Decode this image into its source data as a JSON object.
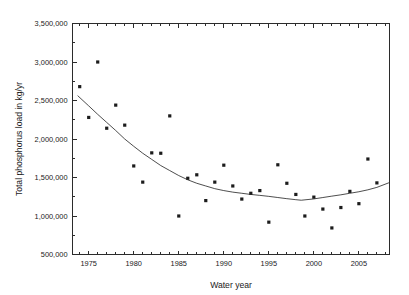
{
  "chart_data": {
    "type": "scatter",
    "title": "",
    "xlabel": "Water year",
    "ylabel": "Total phosphorus load in kg/yr",
    "xlim": [
      1973.2,
      2008.4
    ],
    "ylim": [
      500000,
      3500000
    ],
    "grid": false,
    "legend": "none",
    "x_tick_labels": [
      "1975",
      "1980",
      "1985",
      "1990",
      "1995",
      "2000",
      "2005"
    ],
    "x_tick_values": [
      1975,
      1980,
      1985,
      1990,
      1995,
      2000,
      2005
    ],
    "x_minor_tick_interval": 1,
    "y_tick_labels": [
      "500,000",
      "1,000,000",
      "1,500,000",
      "2,000,000",
      "2,500,000",
      "3,000,000",
      "3,500,000"
    ],
    "y_tick_values": [
      500000,
      1000000,
      1500000,
      2000000,
      2500000,
      3000000,
      3500000
    ],
    "y_minor_tick_interval": 250000,
    "series": [
      {
        "name": "Total phosphorus load",
        "marker": "filled-square",
        "x": [
          1974,
          1975,
          1976,
          1977,
          1978,
          1979,
          1980,
          1981,
          1982,
          1983,
          1984,
          1985,
          1986,
          1987,
          1988,
          1989,
          1990,
          1991,
          1992,
          1993,
          1994,
          1995,
          1996,
          1997,
          1998,
          1999,
          2000,
          2001,
          2002,
          2003,
          2004,
          2005,
          2006,
          2007
        ],
        "values": [
          2680000,
          2280000,
          3000000,
          2140000,
          2440000,
          2180000,
          1650000,
          1440000,
          1820000,
          1815000,
          2300000,
          1000000,
          1490000,
          1535000,
          1200000,
          1440000,
          1660000,
          1390000,
          1220000,
          1295000,
          1330000,
          920000,
          1665000,
          1425000,
          1280000,
          1000000,
          1245000,
          1090000,
          845000,
          1110000,
          1320000,
          1160000,
          1740000,
          1430000
        ]
      },
      {
        "name": "Fitted trend",
        "marker": "none",
        "x": [
          1973.8,
          1975,
          1976,
          1977,
          1978,
          1979,
          1980,
          1981,
          1982,
          1983,
          1984,
          1985,
          1986,
          1987,
          1988,
          1989,
          1990,
          1991,
          1992,
          1993,
          1994,
          1995,
          1996,
          1997,
          1998,
          1998.6,
          2000,
          2001,
          2002,
          2003,
          2004,
          2005,
          2006,
          2007,
          2008.3
        ],
        "values": [
          2560000,
          2430000,
          2320000,
          2215000,
          2110000,
          2000000,
          1905000,
          1815000,
          1735000,
          1655000,
          1590000,
          1525000,
          1470000,
          1425000,
          1390000,
          1355000,
          1330000,
          1310000,
          1295000,
          1280000,
          1268000,
          1255000,
          1240000,
          1225000,
          1212000,
          1205000,
          1222000,
          1240000,
          1258000,
          1275000,
          1295000,
          1315000,
          1340000,
          1372000,
          1430000
        ]
      }
    ]
  },
  "axes": {
    "y_axis_title": "Total phosphorus load in kg/yr",
    "x_axis_title": "Water year"
  }
}
